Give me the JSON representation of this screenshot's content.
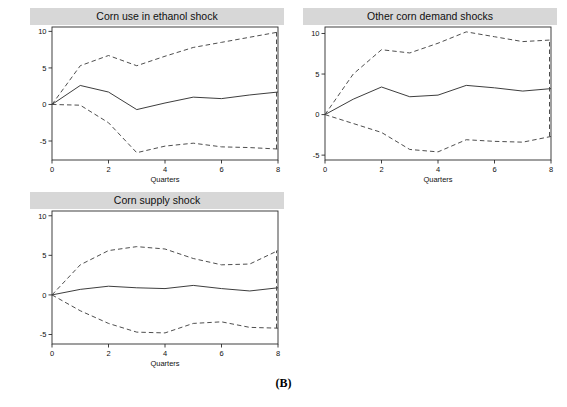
{
  "figure": {
    "label": "(B)",
    "axis_label": "Quarters",
    "yticks": [
      10,
      5,
      0,
      -5
    ],
    "ytick_labels": [
      "10",
      "5",
      "0",
      "-5"
    ],
    "xticks": [
      0,
      2,
      4,
      6,
      8
    ],
    "xtick_labels": [
      "0",
      "2",
      "4",
      "6",
      "8"
    ],
    "line_color": "#333333",
    "band_color": "#444444",
    "title_bar_color": "#d7d7d7",
    "background": "#ffffff"
  },
  "chart_data": [
    {
      "type": "line",
      "title": "Corn use in ethanol shock",
      "xlabel": "Quarters",
      "ylabel": "",
      "xlim": [
        0,
        8
      ],
      "ylim": [
        -7.6,
        10.6
      ],
      "grid": false,
      "legend": "none",
      "x": [
        0,
        1,
        2,
        3,
        4,
        5,
        6,
        7,
        8
      ],
      "series": [
        {
          "name": "Upper 95% band",
          "style": "dashed",
          "values": [
            0.0,
            5.3,
            6.7,
            5.3,
            6.6,
            7.8,
            8.5,
            9.2,
            9.9
          ]
        },
        {
          "name": "Impulse response",
          "style": "solid",
          "values": [
            0.0,
            2.6,
            1.7,
            -0.7,
            0.2,
            1.0,
            0.8,
            1.3,
            1.7
          ]
        },
        {
          "name": "Lower 95% band",
          "style": "dashed",
          "values": [
            0.0,
            -0.1,
            -2.5,
            -6.6,
            -5.7,
            -5.3,
            -5.8,
            -5.9,
            -6.1
          ]
        }
      ],
      "end_vertical_marker": {
        "x": 8,
        "from": -6.1,
        "to": 9.9,
        "style": "dashed"
      }
    },
    {
      "type": "line",
      "title": "Other corn demand shocks",
      "xlabel": "Quarters",
      "ylabel": "",
      "xlim": [
        0,
        8
      ],
      "ylim": [
        -5.6,
        10.8
      ],
      "grid": false,
      "legend": "none",
      "x": [
        0,
        1,
        2,
        3,
        4,
        5,
        6,
        7,
        8
      ],
      "series": [
        {
          "name": "Upper 95% band",
          "style": "dashed",
          "values": [
            0.0,
            5.0,
            8.0,
            7.6,
            8.8,
            10.2,
            9.6,
            9.0,
            9.2
          ]
        },
        {
          "name": "Impulse response",
          "style": "solid",
          "values": [
            0.0,
            1.9,
            3.4,
            2.2,
            2.4,
            3.6,
            3.3,
            2.9,
            3.2
          ]
        },
        {
          "name": "Lower 95% band",
          "style": "dashed",
          "values": [
            0.0,
            -1.1,
            -2.2,
            -4.3,
            -4.6,
            -3.1,
            -3.3,
            -3.4,
            -2.7
          ]
        }
      ],
      "end_vertical_marker": {
        "x": 8,
        "from": -2.7,
        "to": 9.2,
        "style": "dashed"
      }
    },
    {
      "type": "line",
      "title": "Corn supply shock",
      "xlabel": "Quarters",
      "ylabel": "",
      "xlim": [
        0,
        8
      ],
      "ylim": [
        -6.2,
        10.6
      ],
      "grid": false,
      "legend": "none",
      "x": [
        0,
        1,
        2,
        3,
        4,
        5,
        6,
        7,
        8
      ],
      "series": [
        {
          "name": "Upper 95% band",
          "style": "dashed",
          "values": [
            0.0,
            3.8,
            5.6,
            6.1,
            5.8,
            4.6,
            3.8,
            3.9,
            5.6
          ]
        },
        {
          "name": "Impulse response",
          "style": "solid",
          "values": [
            0.0,
            0.7,
            1.1,
            0.9,
            0.8,
            1.2,
            0.8,
            0.5,
            0.9
          ]
        },
        {
          "name": "Lower 95% band",
          "style": "dashed",
          "values": [
            0.0,
            -2.0,
            -3.6,
            -4.7,
            -4.8,
            -3.6,
            -3.4,
            -4.1,
            -4.2
          ]
        }
      ],
      "end_vertical_marker": {
        "x": 8,
        "from": -4.2,
        "to": 5.6,
        "style": "dashed"
      }
    }
  ],
  "panels": [
    {
      "key": "panel-corn-use-in-ethanol-shock",
      "title": "Corn use in ethanol shock"
    },
    {
      "key": "panel-other-corn-demand-shocks",
      "title": "Other corn demand shocks"
    },
    {
      "key": "panel-corn-supply-shock",
      "title": "Corn supply shock"
    }
  ]
}
